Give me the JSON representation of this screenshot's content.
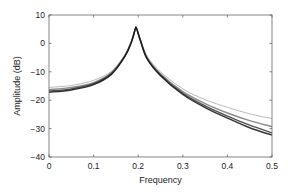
{
  "chart_data": {
    "type": "line",
    "title": "",
    "xlabel": "Frequency",
    "ylabel": "Amplitude (dB)",
    "xlim": [
      0,
      0.5
    ],
    "ylim": [
      -40,
      10
    ],
    "xticks": [
      0,
      0.1,
      0.2,
      0.3,
      0.4,
      0.5
    ],
    "xtick_labels": [
      "0",
      "0.1",
      "0.2",
      "0.3",
      "0.4",
      "0.5"
    ],
    "yticks": [
      10,
      0,
      -10,
      -20,
      -30,
      -40
    ],
    "ytick_labels": [
      "10",
      "0",
      "−10",
      "−20",
      "−30",
      "−40"
    ],
    "grid": false,
    "legend": null,
    "x": [
      0,
      0.05,
      0.1,
      0.14,
      0.17,
      0.185,
      0.195,
      0.205,
      0.22,
      0.25,
      0.3,
      0.35,
      0.4,
      0.45,
      0.5
    ],
    "series": [
      {
        "name": "curve-light",
        "color": "#aaaaaa",
        "values": [
          -15.5,
          -14.8,
          -13.0,
          -9.8,
          -4.0,
          1.0,
          5.8,
          1.5,
          -4.5,
          -10.0,
          -16.0,
          -19.8,
          -22.5,
          -24.8,
          -26.5
        ]
      },
      {
        "name": "curve-mid",
        "color": "#777777",
        "values": [
          -16.3,
          -15.5,
          -13.8,
          -10.3,
          -4.3,
          0.8,
          5.8,
          1.2,
          -5.0,
          -10.7,
          -17.0,
          -21.2,
          -24.5,
          -27.2,
          -29.3
        ]
      },
      {
        "name": "curve-dark",
        "color": "#333333",
        "values": [
          -16.8,
          -16.0,
          -14.2,
          -10.6,
          -4.5,
          0.6,
          5.8,
          1.0,
          -5.3,
          -11.1,
          -17.6,
          -22.0,
          -25.6,
          -28.8,
          -31.5
        ]
      },
      {
        "name": "curve-darkest",
        "color": "#111111",
        "values": [
          -17.2,
          -16.4,
          -14.5,
          -10.9,
          -4.7,
          0.5,
          5.8,
          0.9,
          -5.5,
          -11.4,
          -18.0,
          -22.6,
          -26.3,
          -29.7,
          -32.3
        ]
      }
    ]
  }
}
